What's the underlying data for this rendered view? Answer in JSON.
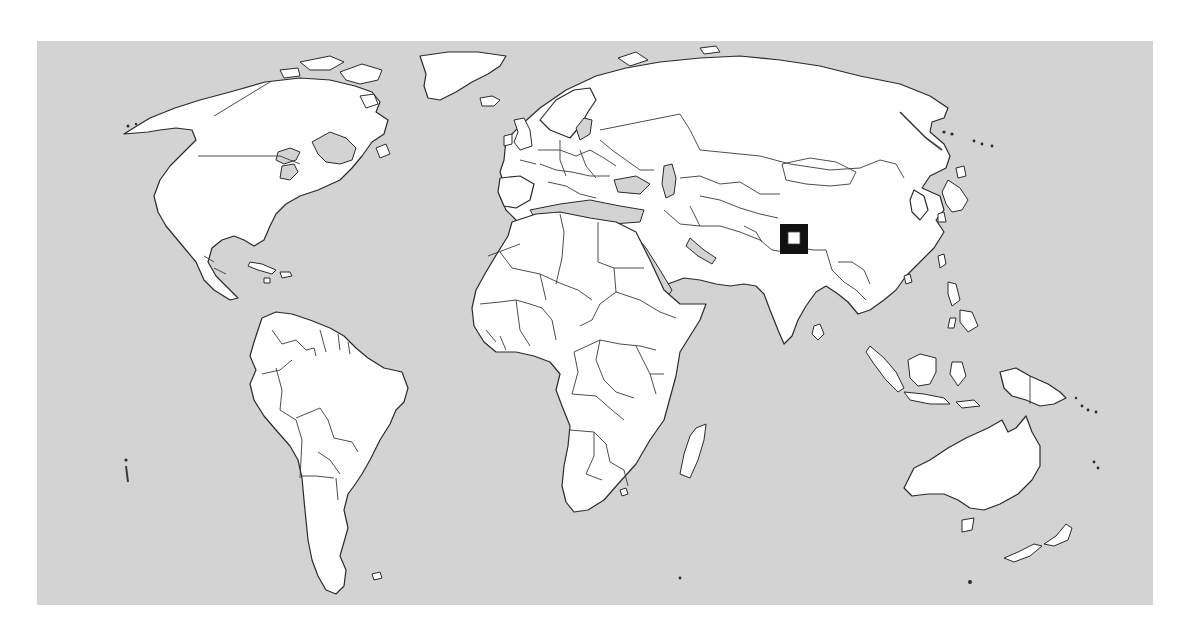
{
  "map": {
    "type": "world-political-outline",
    "projection": "equirectangular, Atlantic-centered",
    "colors": {
      "ocean": "#d3d3d3",
      "land": "#ffffff",
      "outline": "#2a2a2a",
      "marker": "#111111",
      "page_background": "#ffffff"
    },
    "continents": [
      "North America",
      "South America",
      "Europe",
      "Africa",
      "Asia",
      "Australia",
      "Greenland",
      "Antarctica-excluded"
    ],
    "marker": {
      "shape": "square",
      "label": "highlighted-location",
      "approx_region": "Nepal / northern India",
      "screen_position": {
        "x": 794,
        "y": 239
      }
    }
  }
}
